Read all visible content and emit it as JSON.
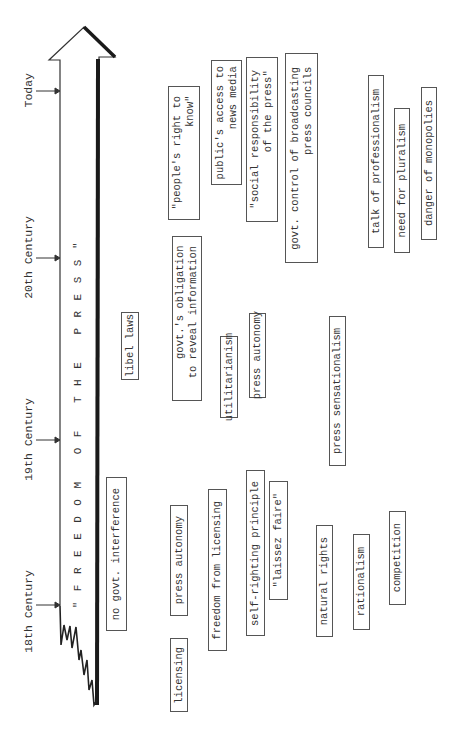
{
  "diagram": {
    "title": "\"FREEDOM OF THE PRESS\"",
    "orientation": "rotated 90° counter-clockwise; time flows bottom (18th Century) to top (Today)",
    "timeline": [
      {
        "label": "18th Century",
        "y": 605
      },
      {
        "label": "19th Century",
        "y": 433
      },
      {
        "label": "20th Century",
        "y": 258
      },
      {
        "label": "Today",
        "y": 91
      }
    ],
    "concepts": [
      {
        "id": "no-govt-interference",
        "text": "no govt. interference",
        "x": 106,
        "y": 477,
        "w": 21,
        "h": 154
      },
      {
        "id": "libel-laws",
        "text": "libel laws",
        "x": 121,
        "y": 312,
        "w": 18,
        "h": 68
      },
      {
        "id": "peoples-right-to-know",
        "text": "\"people's right to\n        know\"",
        "x": 168,
        "y": 86,
        "w": 32,
        "h": 134
      },
      {
        "id": "govts-obligation",
        "text": "govt.'s obligation\n  to reveal information",
        "x": 172,
        "y": 236,
        "w": 30,
        "h": 165
      },
      {
        "id": "press-autonomy-18th",
        "text": "press autonomy",
        "x": 170,
        "y": 505,
        "w": 18,
        "h": 111
      },
      {
        "id": "licensing",
        "text": "licensing",
        "x": 170,
        "y": 638,
        "w": 18,
        "h": 74
      },
      {
        "id": "publics-access",
        "text": "public's access to\n    news media",
        "x": 211,
        "y": 60,
        "w": 31,
        "h": 125
      },
      {
        "id": "utilitarianism",
        "text": "utilitarianism",
        "x": 220,
        "y": 336,
        "w": 18,
        "h": 82
      },
      {
        "id": "freedom-from-licensing",
        "text": "freedom from licensing",
        "x": 208,
        "y": 489,
        "w": 19,
        "h": 162
      },
      {
        "id": "social-responsibility",
        "text": "\"social responsibility\n        of the press\"",
        "x": 246,
        "y": 57,
        "w": 32,
        "h": 165
      },
      {
        "id": "press-autonomy-19th",
        "text": "press autonomy",
        "x": 249,
        "y": 313,
        "w": 17,
        "h": 85
      },
      {
        "id": "self-righting-principle",
        "text": "self-righting principle",
        "x": 246,
        "y": 470,
        "w": 19,
        "h": 166
      },
      {
        "id": "laissez-faire",
        "text": "\"laissez faire\"",
        "x": 269,
        "y": 481,
        "w": 19,
        "h": 119
      },
      {
        "id": "govt-control-broadcasting",
        "text": "govt. control of broadcasting\n      press councils",
        "x": 285,
        "y": 53,
        "w": 33,
        "h": 210
      },
      {
        "id": "natural-rights",
        "text": "natural rights",
        "x": 316,
        "y": 525,
        "w": 17,
        "h": 112
      },
      {
        "id": "press-sensationalism",
        "text": "press sensationalism",
        "x": 329,
        "y": 316,
        "w": 17,
        "h": 150
      },
      {
        "id": "rationalism",
        "text": "rationalism",
        "x": 353,
        "y": 534,
        "w": 17,
        "h": 96
      },
      {
        "id": "talk-of-professionalism",
        "text": "talk of professionalism",
        "x": 368,
        "y": 75,
        "w": 16,
        "h": 173
      },
      {
        "id": "competition",
        "text": "competition",
        "x": 389,
        "y": 511,
        "w": 17,
        "h": 94
      },
      {
        "id": "need-for-pluralism",
        "text": "need for pluralism",
        "x": 394,
        "y": 108,
        "w": 16,
        "h": 145
      },
      {
        "id": "danger-of-monopolies",
        "text": "danger of monopolies",
        "x": 421,
        "y": 87,
        "w": 16,
        "h": 153
      }
    ],
    "colors": {
      "ink": "#333333",
      "background": "#ffffff",
      "arrow_shadow": "#1a1a1a"
    }
  }
}
